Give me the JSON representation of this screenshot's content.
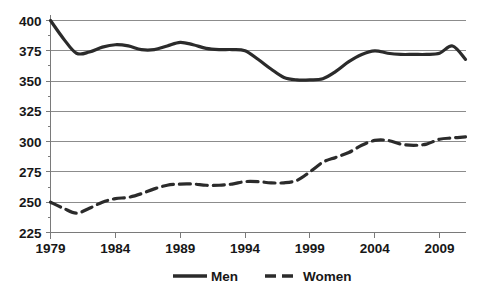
{
  "chart_data": {
    "type": "line",
    "title": "",
    "subtitle": "",
    "xlabel": "",
    "ylabel": "",
    "xlim": [
      1979,
      2011
    ],
    "ylim": [
      225,
      400
    ],
    "yticks": [
      225,
      250,
      275,
      300,
      325,
      350,
      375,
      400
    ],
    "ytick_labels": [
      "225",
      "250",
      "275",
      "300",
      "325",
      "350",
      "375",
      "400"
    ],
    "xticks": [
      1979,
      1984,
      1989,
      1994,
      1999,
      2004,
      2009
    ],
    "xtick_labels": [
      "1979",
      "1984",
      "1989",
      "1994",
      "1999",
      "2004",
      "2009"
    ],
    "grid": true,
    "legend_position": "bottom",
    "x": [
      1979,
      1980,
      1981,
      1982,
      1983,
      1984,
      1985,
      1986,
      1987,
      1988,
      1989,
      1990,
      1991,
      1992,
      1993,
      1994,
      1995,
      1996,
      1997,
      1998,
      1999,
      2000,
      2001,
      2002,
      2003,
      2004,
      2005,
      2006,
      2007,
      2008,
      2009,
      2010,
      2011
    ],
    "series": [
      {
        "name": "Men",
        "style": "solid",
        "color": "#2b2b2b",
        "values": [
          400,
          385,
          373,
          374,
          378,
          380,
          379,
          376,
          376,
          379,
          382,
          380,
          377,
          376,
          376,
          375,
          368,
          360,
          353,
          351,
          351,
          352,
          358,
          366,
          372,
          375,
          373,
          372,
          372,
          372,
          373,
          379,
          368
        ]
      },
      {
        "name": "Women",
        "style": "dashed",
        "color": "#2b2b2b",
        "values": [
          250,
          245,
          241,
          245,
          250,
          253,
          254,
          257,
          261,
          264,
          265,
          265,
          264,
          264,
          265,
          267,
          267,
          266,
          266,
          268,
          275,
          283,
          287,
          291,
          297,
          301,
          301,
          298,
          297,
          298,
          302,
          303,
          304
        ]
      }
    ],
    "legend": [
      {
        "label": "Men",
        "style": "solid"
      },
      {
        "label": "Women",
        "style": "dashed"
      }
    ]
  }
}
